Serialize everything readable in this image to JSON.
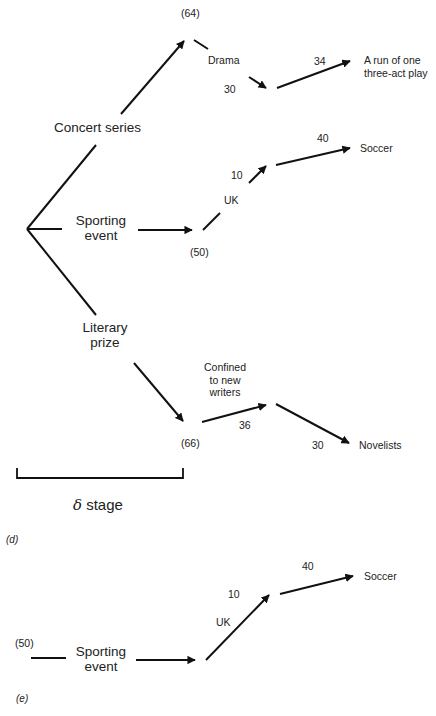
{
  "panel_d": {
    "label": "(d)",
    "root_branches": [
      {
        "label": "Concert series"
      },
      {
        "label_line1": "Sporting",
        "label_line2": "event"
      },
      {
        "label_line1": "Literary",
        "label_line2": "prize"
      }
    ],
    "concert": {
      "node_value": "(64)",
      "sub_label": "Drama",
      "edge_value_1": "30",
      "edge_value_2": "34",
      "outcome_line1": "A run of one",
      "outcome_line2": "three-act play"
    },
    "sporting": {
      "node_value": "(50)",
      "sub_label": "UK",
      "edge_value_1": "10",
      "edge_value_2": "40",
      "outcome": "Soccer"
    },
    "literary": {
      "node_value": "(66)",
      "sub_label_line1": "Confined",
      "sub_label_line2": "to new",
      "sub_label_line3": "writers",
      "edge_value_1": "36",
      "edge_value_2": "30",
      "outcome": "Novelists"
    },
    "stage": {
      "symbol": "δ",
      "label": "stage"
    }
  },
  "panel_e": {
    "label": "(e)",
    "node_value": "(50)",
    "branch_line1": "Sporting",
    "branch_line2": "event",
    "sub_label": "UK",
    "edge_value_1": "10",
    "edge_value_2": "40",
    "outcome": "Soccer"
  }
}
